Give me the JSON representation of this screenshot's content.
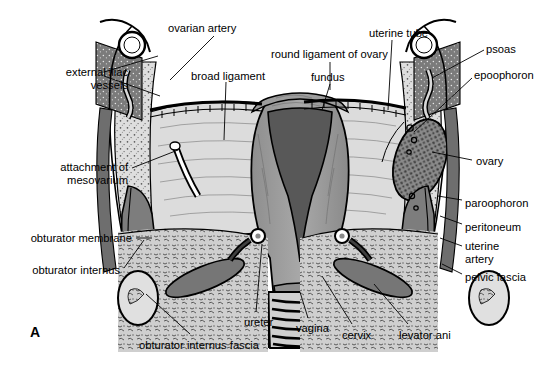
{
  "figure": {
    "panel_label": "A",
    "background_color": "#ffffff",
    "ink_color": "#000000"
  },
  "palette": {
    "paper": "#ffffff",
    "outline": "#000000",
    "muscle_dark": "#6f6f6f",
    "muscle_mid": "#8d8d8d",
    "myometrium": "#9a9a9a",
    "cavity_dark": "#565656",
    "broad_ligament": "#d2d2d2",
    "loose_tissue": "#c9c9c9",
    "bone_speckle": "#dcdcdc",
    "ovary_stipple": "#707070"
  },
  "labels": [
    {
      "id": "ovarian-artery",
      "text": "ovarian artery",
      "x": 168,
      "y": 22,
      "align": "left"
    },
    {
      "id": "external-iliac-vessels",
      "text": "external iliac\nvessels",
      "x": 38,
      "y": 66,
      "align": "left"
    },
    {
      "id": "broad-ligament",
      "text": "broad ligament",
      "x": 191,
      "y": 70,
      "align": "left"
    },
    {
      "id": "round-ligament-of-ovary",
      "text": "round ligament of ovary",
      "x": 271,
      "y": 48,
      "align": "left"
    },
    {
      "id": "uterine-tube",
      "text": "uterine tube",
      "x": 369,
      "y": 27,
      "align": "left"
    },
    {
      "id": "fundus",
      "text": "fundus",
      "x": 311,
      "y": 71,
      "align": "left"
    },
    {
      "id": "psoas",
      "text": "psoas",
      "x": 486,
      "y": 43,
      "align": "left"
    },
    {
      "id": "epoophoron",
      "text": "epoophoron",
      "x": 474,
      "y": 69,
      "align": "left"
    },
    {
      "id": "ovary",
      "text": "ovary",
      "x": 476,
      "y": 155,
      "align": "left"
    },
    {
      "id": "attachment-of-mesovarium",
      "text": "attachment of\nmesovarium",
      "x": 128,
      "y": 161,
      "align": "right"
    },
    {
      "id": "paroophoron",
      "text": "paroophoron",
      "x": 465,
      "y": 197,
      "align": "left"
    },
    {
      "id": "peritoneum",
      "text": "peritoneum",
      "x": 465,
      "y": 221,
      "align": "left"
    },
    {
      "id": "uterine-artery",
      "text": "uterine\nartery",
      "x": 465,
      "y": 240,
      "align": "left"
    },
    {
      "id": "pelvic-fascia",
      "text": "pelvic fascia",
      "x": 465,
      "y": 271,
      "align": "left"
    },
    {
      "id": "obturator-membrane",
      "text": "obturator membrane",
      "x": 132,
      "y": 232,
      "align": "right"
    },
    {
      "id": "obturator-internus",
      "text": "obturator internus",
      "x": 120,
      "y": 264,
      "align": "right"
    },
    {
      "id": "obturator-internus-fascia",
      "text": "obturator internus fascia",
      "x": 139,
      "y": 339,
      "align": "left"
    },
    {
      "id": "ureter",
      "text": "ureter",
      "x": 244,
      "y": 316,
      "align": "left"
    },
    {
      "id": "vagina",
      "text": "vagina",
      "x": 296,
      "y": 322,
      "align": "left"
    },
    {
      "id": "cervix",
      "text": "cervix",
      "x": 342,
      "y": 329,
      "align": "left"
    },
    {
      "id": "levator-ani",
      "text": "levator ani",
      "x": 399,
      "y": 329,
      "align": "left"
    }
  ],
  "structures": [
    "uterus-body",
    "uterine-cavity",
    "fundus",
    "cervix",
    "vagina",
    "broad-ligament-left",
    "broad-ligament-right",
    "uterine-tube-left",
    "uterine-tube-right",
    "ovary-right",
    "round-ligament",
    "psoas-left",
    "psoas-right",
    "obturator-internus-left",
    "obturator-internus-right",
    "levator-ani-left",
    "levator-ani-right",
    "pelvic-bone-left",
    "pelvic-bone-right",
    "external-iliac-vessels-left",
    "external-iliac-vessels-right",
    "ureter-left",
    "ureter-right",
    "uterine-artery-left",
    "uterine-artery-right"
  ]
}
